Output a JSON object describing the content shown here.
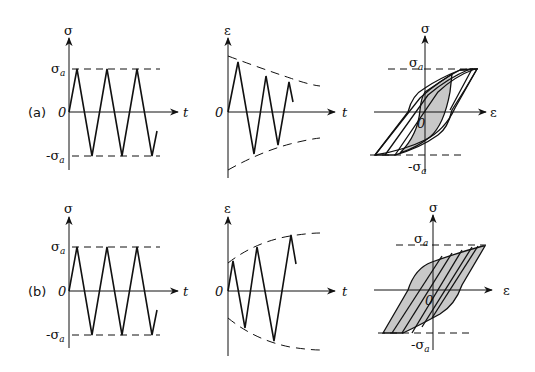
{
  "figure": {
    "rows": [
      {
        "tag": "(a)",
        "stress_plot": {
          "y_label": "σ",
          "x_label": "t",
          "origin": "0",
          "upper": "σ",
          "upper_sub": "a",
          "lower": "-σ",
          "lower_sub": "a"
        },
        "strain_plot": {
          "y_label": "ε",
          "x_label": "t",
          "origin": "0",
          "trend": "decreasing envelope"
        },
        "loop_plot": {
          "y_label": "σ",
          "x_label": "ε",
          "origin": "0",
          "upper": "σ",
          "upper_sub": "a",
          "lower": "-σ",
          "lower_sub": "a",
          "drift": "rightward"
        }
      },
      {
        "tag": "(b)",
        "stress_plot": {
          "y_label": "σ",
          "x_label": "t",
          "origin": "0",
          "upper": "σ",
          "upper_sub": "a",
          "lower": "-σ",
          "lower_sub": "a"
        },
        "strain_plot": {
          "y_label": "ε",
          "x_label": "t",
          "origin": "0",
          "trend": "increasing envelope"
        },
        "loop_plot": {
          "y_label": "σ",
          "x_label": "ε",
          "origin": "0",
          "upper": "σ",
          "upper_sub": "a",
          "lower": "-σ",
          "lower_sub": "a",
          "drift": "rightward"
        }
      }
    ]
  },
  "colors": {
    "line": "#111111",
    "shade": "#c8c8c8",
    "background": "#ffffff"
  }
}
